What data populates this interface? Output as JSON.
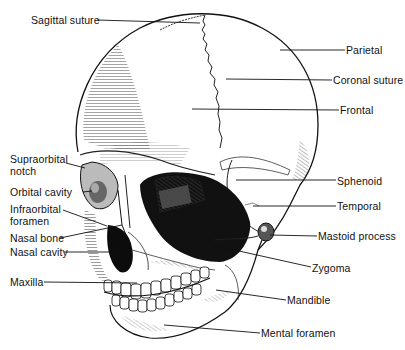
{
  "diagram": {
    "labels": [
      {
        "id": "sagittal-suture",
        "text": "Sagittal suture",
        "x": 31,
        "y": 14
      },
      {
        "id": "parietal",
        "text": "Parietal",
        "x": 346,
        "y": 45
      },
      {
        "id": "coronal-suture",
        "text": "Coronal suture",
        "x": 333,
        "y": 75
      },
      {
        "id": "frontal",
        "text": "Frontal",
        "x": 340,
        "y": 105
      },
      {
        "id": "supraorbital-notch-1",
        "text": "Supraorbital",
        "x": 10,
        "y": 155
      },
      {
        "id": "supraorbital-notch-2",
        "text": "notch",
        "x": 10,
        "y": 167
      },
      {
        "id": "orbital-cavity",
        "text": "Orbital cavity",
        "x": 10,
        "y": 187
      },
      {
        "id": "infraorbital-foramen-1",
        "text": "Infraorbital",
        "x": 10,
        "y": 204
      },
      {
        "id": "infraorbital-foramen-2",
        "text": "foramen",
        "x": 10,
        "y": 216
      },
      {
        "id": "sphenoid",
        "text": "Sphenoid",
        "x": 337,
        "y": 176
      },
      {
        "id": "temporal",
        "text": "Temporal",
        "x": 337,
        "y": 201
      },
      {
        "id": "nasal-bone",
        "text": "Nasal bone",
        "x": 10,
        "y": 233
      },
      {
        "id": "mastoid-process",
        "text": "Mastoid process",
        "x": 318,
        "y": 231
      },
      {
        "id": "nasal-cavity",
        "text": "Nasal cavity",
        "x": 10,
        "y": 248
      },
      {
        "id": "zygoma",
        "text": "Zygoma",
        "x": 312,
        "y": 263
      },
      {
        "id": "maxilla",
        "text": "Maxilla",
        "x": 10,
        "y": 277
      },
      {
        "id": "mandible",
        "text": "Mandible",
        "x": 287,
        "y": 295
      },
      {
        "id": "mental-foramen",
        "text": "Mental foramen",
        "x": 261,
        "y": 328
      }
    ],
    "leader_lines": [
      {
        "to": "sagittal-suture",
        "x1": 97,
        "y1": 20,
        "x2": 200,
        "y2": 23
      },
      {
        "to": "parietal",
        "x1": 280,
        "y1": 50,
        "x2": 345,
        "y2": 50
      },
      {
        "to": "coronal-suture",
        "x1": 226,
        "y1": 79,
        "x2": 332,
        "y2": 80
      },
      {
        "to": "frontal",
        "x1": 192,
        "y1": 109,
        "x2": 339,
        "y2": 110
      },
      {
        "to": "supraorbital-notch",
        "x1": 66,
        "y1": 163,
        "x2": 85,
        "y2": 168
      },
      {
        "to": "orbital-cavity",
        "x1": 83,
        "y1": 192,
        "x2": 92,
        "y2": 191
      },
      {
        "to": "infraorbital-foramen",
        "x1": 63,
        "y1": 210,
        "x2": 107,
        "y2": 226
      },
      {
        "to": "sphenoid",
        "x1": 236,
        "y1": 180,
        "x2": 336,
        "y2": 180
      },
      {
        "to": "temporal",
        "x1": 253,
        "y1": 206,
        "x2": 336,
        "y2": 206
      },
      {
        "to": "nasal-bone",
        "x1": 60,
        "y1": 238,
        "x2": 122,
        "y2": 225
      },
      {
        "to": "mastoid-process",
        "x1": 270,
        "y1": 235,
        "x2": 317,
        "y2": 236
      },
      {
        "to": "nasal-cavity",
        "x1": 64,
        "y1": 252,
        "x2": 119,
        "y2": 252
      },
      {
        "to": "zygoma",
        "x1": 212,
        "y1": 245,
        "x2": 311,
        "y2": 267
      },
      {
        "to": "maxilla",
        "x1": 44,
        "y1": 282,
        "x2": 137,
        "y2": 283
      },
      {
        "to": "mandible",
        "x1": 216,
        "y1": 290,
        "x2": 286,
        "y2": 300
      },
      {
        "to": "mental-foramen",
        "x1": 164,
        "y1": 325,
        "x2": 260,
        "y2": 333
      }
    ]
  }
}
